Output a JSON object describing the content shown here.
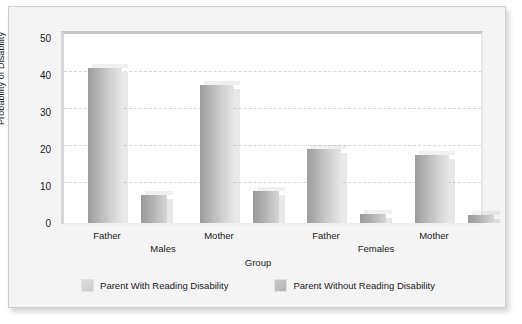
{
  "chart_data": {
    "type": "bar",
    "title": "",
    "xlabel": "Group",
    "ylabel": "Probability of Disability",
    "ylim": [
      0,
      50
    ],
    "yticks": [
      0,
      10,
      20,
      30,
      40,
      50
    ],
    "grid": true,
    "legend_position": "bottom",
    "categories": [
      "Father",
      "Mother",
      "Father",
      "Mother"
    ],
    "supergroups": [
      {
        "label": "Males",
        "categories": [
          "Father",
          "Mother"
        ]
      },
      {
        "label": "Females",
        "categories": [
          "Father",
          "Mother"
        ]
      }
    ],
    "series": [
      {
        "name": "Parent With Reading Disability",
        "color": "#b4b4b4",
        "values": [
          41,
          36.5,
          19.5,
          18
        ]
      },
      {
        "name": "Parent Without Reading Disability",
        "color": "#acacac",
        "values": [
          7.5,
          8.5,
          2.5,
          2
        ]
      }
    ]
  },
  "axis": {
    "y_title": "Probability of Disability",
    "x_title": "Group",
    "y_tick_labels": [
      "50",
      "40",
      "30",
      "20",
      "10",
      "0"
    ]
  },
  "x_labels": {
    "males_father": "Father",
    "males_mother": "Mother",
    "females_father": "Father",
    "females_mother": "Mother",
    "males": "Males",
    "females": "Females"
  },
  "legend": {
    "items": [
      {
        "label": "Parent With Reading Disability",
        "swatch": "legend-swatch-with-reading-disability"
      },
      {
        "label": "Parent Without Reading Disability",
        "swatch": "legend-swatch-without-reading-disability"
      }
    ]
  }
}
